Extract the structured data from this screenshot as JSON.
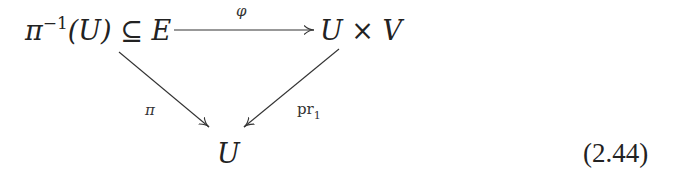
{
  "diagram": {
    "type": "commutative-diagram",
    "nodes": {
      "top_left": {
        "preimage_base": "π",
        "preimage_sup": "−1",
        "preimage_arg": "(U)",
        "relation": "⊆",
        "space": "E"
      },
      "top_right": {
        "left": "U",
        "op": "×",
        "right": "V"
      },
      "bottom": {
        "label": "U"
      }
    },
    "arrows": [
      {
        "from": "top_left",
        "to": "top_right",
        "label": "φ"
      },
      {
        "from": "top_left",
        "to": "bottom",
        "label": "π"
      },
      {
        "from": "top_right",
        "to": "bottom",
        "label_base": "pr",
        "label_sub": "1"
      }
    ],
    "equation_number": "(2.44)",
    "colors": {
      "ink": "#222222",
      "background": "#ffffff"
    }
  }
}
